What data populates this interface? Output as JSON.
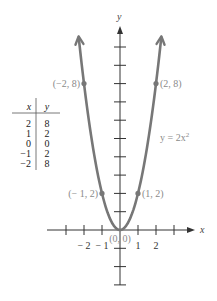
{
  "chart_data": {
    "type": "line",
    "title": "",
    "equation_label": "y = 2x",
    "equation_exponent": "2",
    "xlabel": "x",
    "ylabel": "y",
    "function": "y = 2x^2",
    "x_tick_values": [
      -3,
      -2,
      -1,
      1,
      2,
      3
    ],
    "x_tick_labels": [
      {
        "value": -2,
        "label": "− 2"
      },
      {
        "value": -1,
        "label": "− 1"
      },
      {
        "value": 1,
        "label": "1"
      },
      {
        "value": 2,
        "label": "2"
      }
    ],
    "y_tick_values": [
      -3,
      -2,
      -1,
      1,
      2,
      3,
      4,
      5,
      6,
      7,
      8,
      9,
      10
    ],
    "xlim": [
      -4,
      4.2
    ],
    "ylim": [
      -3,
      11
    ],
    "grid": false,
    "series": [
      {
        "name": "y = 2x^2",
        "x": [
          -2.3,
          -2,
          -1.5,
          -1,
          -0.5,
          0,
          0.5,
          1,
          1.5,
          2,
          2.3
        ],
        "y": [
          10.58,
          8,
          4.5,
          2,
          0.5,
          0,
          0.5,
          2,
          4.5,
          8,
          10.58
        ],
        "color": "#777777"
      }
    ],
    "points": [
      {
        "x": -2,
        "y": 8,
        "label": "(−2, 8)"
      },
      {
        "x": 2,
        "y": 8,
        "label": "(2, 8)"
      },
      {
        "x": -1,
        "y": 2,
        "label": "(− 1, 2)"
      },
      {
        "x": 1,
        "y": 2,
        "label": "(1, 2)"
      },
      {
        "x": 0,
        "y": 0,
        "label": "(0, 0)"
      }
    ],
    "table": {
      "headers": [
        "x",
        "y"
      ],
      "rows": [
        [
          "2",
          "8"
        ],
        [
          "1",
          "2"
        ],
        [
          "0",
          "0"
        ],
        [
          "−1",
          "2"
        ],
        [
          "−2",
          "8"
        ]
      ]
    }
  },
  "colors": {
    "curve": "#777777",
    "axis": "#333333",
    "label": "#8a8a8a"
  }
}
